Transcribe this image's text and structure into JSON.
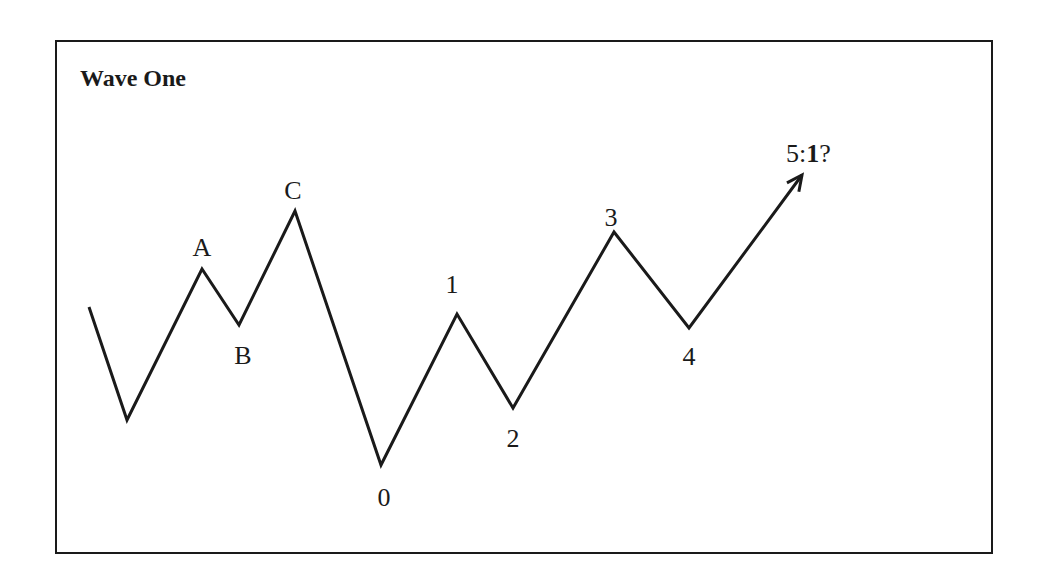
{
  "title": "Wave One",
  "colors": {
    "line": "#1a1a1a",
    "background": "#ffffff",
    "border": "#1a1a1a"
  },
  "wave": {
    "points": [
      {
        "x": 89,
        "y": 307
      },
      {
        "x": 127,
        "y": 420
      },
      {
        "x": 202,
        "y": 269
      },
      {
        "x": 239,
        "y": 325
      },
      {
        "x": 295,
        "y": 211
      },
      {
        "x": 381,
        "y": 465
      },
      {
        "x": 457,
        "y": 314
      },
      {
        "x": 513,
        "y": 408
      },
      {
        "x": 614,
        "y": 232
      },
      {
        "x": 689,
        "y": 328
      },
      {
        "x": 802,
        "y": 175
      }
    ],
    "labels": [
      {
        "id": "A",
        "text": "A",
        "x": 202,
        "y": 256
      },
      {
        "id": "B",
        "text": "B",
        "x": 243,
        "y": 364
      },
      {
        "id": "C",
        "text": "C",
        "x": 293,
        "y": 199
      },
      {
        "id": "0",
        "text": "0",
        "x": 384,
        "y": 506
      },
      {
        "id": "1",
        "text": "1",
        "x": 452,
        "y": 293
      },
      {
        "id": "2",
        "text": "2",
        "x": 513,
        "y": 447
      },
      {
        "id": "3",
        "text": "3",
        "x": 611,
        "y": 226
      },
      {
        "id": "4",
        "text": "4",
        "x": 689,
        "y": 365
      }
    ],
    "projection_label": {
      "prefix": "5:",
      "bold": "1",
      "suffix": "?",
      "x": 786,
      "y": 162
    }
  }
}
